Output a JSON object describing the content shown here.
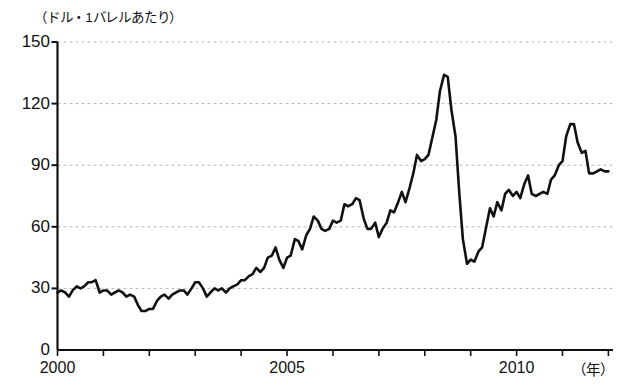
{
  "chart_data": {
    "type": "line",
    "title": "（ドル・1バレルあたり）",
    "xlabel": "（年）",
    "ylabel": "",
    "ylim": [
      0,
      150
    ],
    "xlim": [
      2000,
      2012.1
    ],
    "grid": true,
    "legend": null,
    "yticks": [
      0,
      30,
      60,
      90,
      120,
      150
    ],
    "ytick_labels": [
      "0",
      "30",
      "60",
      "90",
      "120",
      "150"
    ],
    "xticks": [
      2000,
      2001,
      2002,
      2003,
      2004,
      2005,
      2006,
      2007,
      2008,
      2009,
      2010,
      2011,
      2012
    ],
    "xtick_labels_shown": [
      "2000",
      "2005",
      "2010"
    ],
    "xtick_labels_shown_at": [
      2000,
      2005,
      2010
    ],
    "series": [
      {
        "name": "原油価格",
        "color": "#111111",
        "x": [
          2000.0,
          2000.08,
          2000.17,
          2000.25,
          2000.33,
          2000.42,
          2000.5,
          2000.58,
          2000.67,
          2000.75,
          2000.83,
          2000.92,
          2001.0,
          2001.08,
          2001.17,
          2001.25,
          2001.33,
          2001.42,
          2001.5,
          2001.58,
          2001.67,
          2001.75,
          2001.83,
          2001.92,
          2002.0,
          2002.08,
          2002.17,
          2002.25,
          2002.33,
          2002.42,
          2002.5,
          2002.58,
          2002.67,
          2002.75,
          2002.83,
          2002.92,
          2003.0,
          2003.08,
          2003.17,
          2003.25,
          2003.33,
          2003.42,
          2003.5,
          2003.58,
          2003.67,
          2003.75,
          2003.83,
          2003.92,
          2004.0,
          2004.08,
          2004.17,
          2004.25,
          2004.33,
          2004.42,
          2004.5,
          2004.58,
          2004.67,
          2004.75,
          2004.83,
          2004.92,
          2005.0,
          2005.08,
          2005.17,
          2005.25,
          2005.33,
          2005.42,
          2005.5,
          2005.58,
          2005.67,
          2005.75,
          2005.83,
          2005.92,
          2006.0,
          2006.08,
          2006.17,
          2006.25,
          2006.33,
          2006.42,
          2006.5,
          2006.58,
          2006.67,
          2006.75,
          2006.83,
          2006.92,
          2007.0,
          2007.08,
          2007.17,
          2007.25,
          2007.33,
          2007.42,
          2007.5,
          2007.58,
          2007.67,
          2007.75,
          2007.83,
          2007.92,
          2008.0,
          2008.08,
          2008.17,
          2008.25,
          2008.33,
          2008.42,
          2008.5,
          2008.58,
          2008.67,
          2008.75,
          2008.83,
          2008.92,
          2009.0,
          2009.08,
          2009.17,
          2009.25,
          2009.33,
          2009.42,
          2009.5,
          2009.58,
          2009.67,
          2009.75,
          2009.83,
          2009.92,
          2010.0,
          2010.08,
          2010.17,
          2010.25,
          2010.33,
          2010.42,
          2010.5,
          2010.58,
          2010.67,
          2010.75,
          2010.83,
          2010.92,
          2011.0,
          2011.08,
          2011.17,
          2011.25,
          2011.33,
          2011.42,
          2011.5,
          2011.58,
          2011.67,
          2011.75,
          2011.83,
          2011.92,
          2012.0
        ],
        "values": [
          28,
          29,
          28,
          26,
          29,
          31,
          30,
          31,
          33,
          33,
          34,
          28,
          29,
          29,
          27,
          28,
          29,
          28,
          26,
          27,
          26,
          22,
          19,
          19,
          20,
          20,
          24,
          26,
          27,
          25,
          27,
          28,
          29,
          29,
          27,
          30,
          33,
          33,
          30,
          26,
          28,
          30,
          29,
          30,
          28,
          30,
          31,
          32,
          34,
          34,
          36,
          37,
          40,
          38,
          40,
          45,
          46,
          50,
          44,
          40,
          45,
          46,
          54,
          53,
          49,
          56,
          59,
          65,
          63,
          59,
          58,
          59,
          63,
          62,
          63,
          71,
          70,
          71,
          74,
          73,
          64,
          59,
          59,
          62,
          55,
          59,
          62,
          68,
          67,
          72,
          77,
          72,
          79,
          86,
          95,
          92,
          93,
          95,
          104,
          112,
          126,
          134,
          133,
          117,
          104,
          77,
          54,
          42,
          44,
          43,
          48,
          50,
          59,
          69,
          65,
          72,
          68,
          76,
          78,
          75,
          77,
          74,
          81,
          85,
          76,
          75,
          76,
          77,
          76,
          83,
          85,
          90,
          92,
          104,
          110,
          110,
          101,
          96,
          97,
          86,
          86,
          87,
          88,
          87,
          87
        ]
      }
    ]
  },
  "axis": {
    "y_title": "（ドル・1バレルあたり）",
    "x_unit": "（年）"
  },
  "colors": {
    "line": "#111111",
    "axis": "#111111",
    "grid": "#b8b8b8",
    "background": "#ffffff"
  }
}
